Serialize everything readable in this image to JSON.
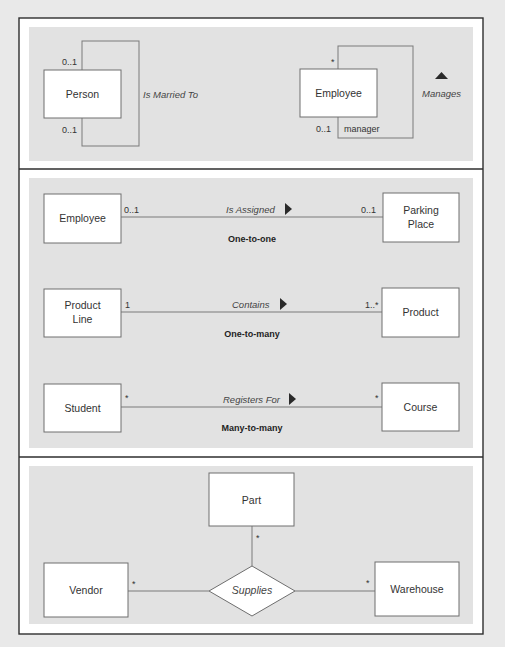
{
  "panels": [
    {
      "title": "recursive-associations",
      "person": {
        "name": "Person",
        "mult_top": "0..1",
        "mult_bottom": "0..1",
        "association": "Is Married To"
      },
      "employee": {
        "name": "Employee",
        "mult_top": "*",
        "mult_bottom": "0..1",
        "role": "manager",
        "association": "Manages",
        "direction": "up"
      }
    },
    {
      "title": "binary-associations",
      "rows": [
        {
          "left": [
            "Employee"
          ],
          "left_mult": "0..1",
          "association": "Is Assigned",
          "direction": "right",
          "right_mult": "0..1",
          "right": [
            "Parking",
            "Place"
          ],
          "kind": "One-to-one"
        },
        {
          "left": [
            "Product",
            "Line"
          ],
          "left_mult": "1",
          "association": "Contains",
          "direction": "right",
          "right_mult": "1..*",
          "right": [
            "Product"
          ],
          "kind": "One-to-many"
        },
        {
          "left": [
            "Student"
          ],
          "left_mult": "*",
          "association": "Registers For",
          "direction": "right",
          "right_mult": "*",
          "right": [
            "Course"
          ],
          "kind": "Many-to-many"
        }
      ]
    },
    {
      "title": "ternary-association",
      "top": {
        "name": "Part",
        "mult": "*"
      },
      "left": {
        "name": "Vendor",
        "mult": "*"
      },
      "right": {
        "name": "Warehouse",
        "mult": "*"
      },
      "association": "Supplies"
    }
  ],
  "colors": {
    "background": "#e9e9e9",
    "panel": "#e2e2e2",
    "border": "#2e2e2e",
    "box_fill": "#ffffff",
    "line": "#7a7a7a"
  }
}
